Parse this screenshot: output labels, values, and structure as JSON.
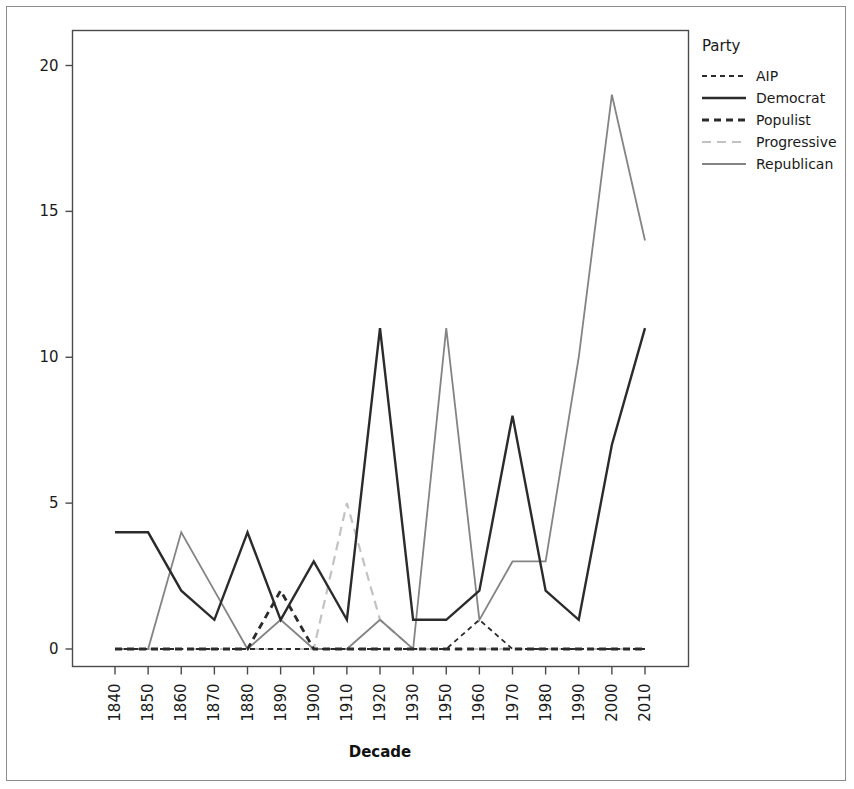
{
  "chart_data": {
    "type": "line",
    "title": "",
    "xlabel": "Decade",
    "ylabel": "",
    "categories": [
      "1840",
      "1850",
      "1860",
      "1870",
      "1880",
      "1890",
      "1900",
      "1910",
      "1920",
      "1930",
      "1950",
      "1960",
      "1970",
      "1980",
      "1990",
      "2000",
      "2010"
    ],
    "x_tick_labels": [
      "1840",
      "1850",
      "1860",
      "1870",
      "1880",
      "1890",
      "1900",
      "1910",
      "1920",
      "1930",
      "1950",
      "1960",
      "1970",
      "1980",
      "1990",
      "2000",
      "2010"
    ],
    "y_tick_labels": [
      "0",
      "5",
      "10",
      "15",
      "20"
    ],
    "y_ticks": [
      0,
      5,
      10,
      15,
      20
    ],
    "ylim": [
      -0.6,
      21.2
    ],
    "grid": false,
    "legend_position": "right",
    "legend_title": "Party",
    "series": [
      {
        "name": "AIP",
        "color": "#2b2b2b",
        "dash": "5,4",
        "width": 1.8,
        "values": [
          0,
          0,
          0,
          0,
          0,
          0,
          0,
          0,
          0,
          0,
          0,
          1,
          0,
          0,
          0,
          0,
          0
        ]
      },
      {
        "name": "Democrat",
        "color": "#2b2b2b",
        "dash": "none",
        "width": 2.4,
        "values": [
          4,
          4,
          2,
          1,
          4,
          1,
          3,
          1,
          11,
          1,
          1,
          2,
          8,
          2,
          1,
          7,
          11
        ]
      },
      {
        "name": "Populist",
        "color": "#2b2b2b",
        "dash": "7,5",
        "width": 2.8,
        "values": [
          0,
          0,
          0,
          0,
          0,
          2,
          0,
          0,
          0,
          0,
          0,
          0,
          0,
          0,
          0,
          0,
          0
        ]
      },
      {
        "name": "Progressive",
        "color": "#c2c2c2",
        "dash": "9,6",
        "width": 2.2,
        "values": [
          0,
          0,
          0,
          0,
          0,
          0,
          0,
          5,
          1,
          0,
          0,
          0,
          0,
          0,
          0,
          0,
          0
        ]
      },
      {
        "name": "Republican",
        "color": "#848484",
        "dash": "none",
        "width": 1.8,
        "values": [
          0,
          0,
          4,
          2,
          0,
          1,
          0,
          0,
          1,
          0,
          11,
          1,
          3,
          3,
          10,
          19,
          14
        ]
      }
    ]
  },
  "legend": {
    "title": "Party",
    "items": [
      {
        "label": "AIP"
      },
      {
        "label": "Democrat"
      },
      {
        "label": "Populist"
      },
      {
        "label": "Progressive"
      },
      {
        "label": "Republican"
      }
    ]
  },
  "axes": {
    "x_title": "Decade",
    "y_title": ""
  }
}
